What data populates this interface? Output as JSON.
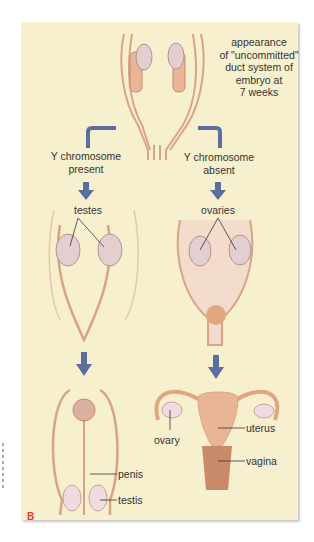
{
  "figure": {
    "letter": "B",
    "colors": {
      "panel_bg": "#f7f0cf",
      "arrow": "#5a6fa0",
      "tissue": "#e8b597",
      "tissue_dark": "#c98a6a",
      "gonad": "#e3cfd0",
      "label_text": "#333333",
      "letter": "#e2402a"
    }
  },
  "labels": {
    "top_caption": [
      "appearance",
      "of \"uncommitted\"",
      "duct system of",
      "embryo at",
      "7 weeks"
    ],
    "left_branch": [
      "Y chromosome",
      "present"
    ],
    "right_branch": [
      "Y chromosome",
      "absent"
    ],
    "testes": "testes",
    "ovaries": "ovaries",
    "penis": "penis",
    "testis": "testis",
    "ovary": "ovary",
    "uterus": "uterus",
    "vagina": "vagina"
  }
}
